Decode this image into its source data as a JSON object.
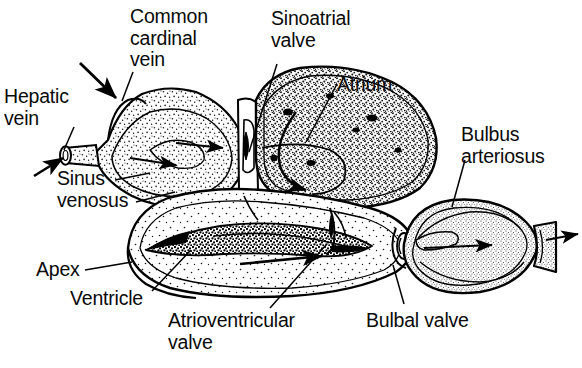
{
  "figure": {
    "background_color": "#ffffff",
    "ink_color": "#000000",
    "stipple_color": "#1a1a1a"
  },
  "labels": {
    "hepatic_vein": "Hepatic\nvein",
    "common_cardinal_vein": "Common\ncardinal\nvein",
    "sinoatrial_valve": "Sinoatrial\nvalve",
    "atrium": "Atrium",
    "bulbus_arteriosus": "Bulbus\narteriosus",
    "sinus_venosus": "Sinus\nvenosus",
    "apex": "Apex",
    "ventricle": "Ventricle",
    "atrioventricular_valve": "Atrioventricular\nvalve",
    "bulbal_valve": "Bulbal valve"
  },
  "structures": [
    {
      "name": "sinus-venosus",
      "description": "Thin-walled triangular stippled chamber at left receiving hepatic and common cardinal veins"
    },
    {
      "name": "atrium",
      "description": "Large dark-stippled chamber in upper centre-right with curved internal flow arrow"
    },
    {
      "name": "ventricle",
      "description": "Thick muscular chamber below with trabeculated dark band and light stippled lumen"
    },
    {
      "name": "bulbus-arteriosus",
      "description": "Spindle-shaped elastic chamber at right tapering into the ventral aorta"
    },
    {
      "name": "sinoatrial-valve",
      "description": "Valve between sinus venosus and atrium"
    },
    {
      "name": "atrioventricular-valve",
      "description": "Valve between atrium and ventricle"
    },
    {
      "name": "bulbal-valve",
      "description": "Valve between ventricle and bulbus arteriosus"
    }
  ],
  "flow_arrows": [
    {
      "name": "hepatic-vein-inflow",
      "direction": "right",
      "location": "far left tube"
    },
    {
      "name": "common-cardinal-vein-inflow",
      "direction": "down-right",
      "location": "top left bump"
    },
    {
      "name": "sinus-venosus-flow-upper",
      "direction": "right",
      "location": "sinus venosus"
    },
    {
      "name": "sinus-venosus-flow-lower",
      "direction": "right",
      "location": "sinus venosus"
    },
    {
      "name": "atrium-flow",
      "direction": "curved down-left",
      "location": "atrium"
    },
    {
      "name": "ventricle-flow",
      "direction": "right",
      "location": "ventricle"
    },
    {
      "name": "bulbus-flow",
      "direction": "right",
      "location": "bulbus arteriosus"
    },
    {
      "name": "ventral-aorta-outflow",
      "direction": "right",
      "location": "far right tube"
    }
  ]
}
